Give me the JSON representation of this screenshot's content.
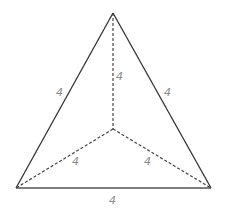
{
  "figure": {
    "type": "tetrahedron-projection",
    "colors": {
      "solid_edge": "#333333",
      "dashed_edge": "#444444",
      "label": "#8a8a8a",
      "background": "#ffffff"
    },
    "vertices": {
      "apex": [
        113,
        13
      ],
      "bottom_left": [
        16,
        188
      ],
      "bottom_right": [
        211,
        188
      ],
      "center": [
        113,
        129
      ]
    },
    "edges": [
      {
        "name": "left-edge",
        "style": "solid",
        "label": "4"
      },
      {
        "name": "right-edge",
        "style": "solid",
        "label": "4"
      },
      {
        "name": "bottom-edge",
        "style": "solid",
        "label": "4"
      },
      {
        "name": "vertical-hidden-edge",
        "style": "dashed",
        "label": "4"
      },
      {
        "name": "left-hidden-edge",
        "style": "dashed",
        "label": "4"
      },
      {
        "name": "right-hidden-edge",
        "style": "dashed",
        "label": "4"
      }
    ]
  }
}
